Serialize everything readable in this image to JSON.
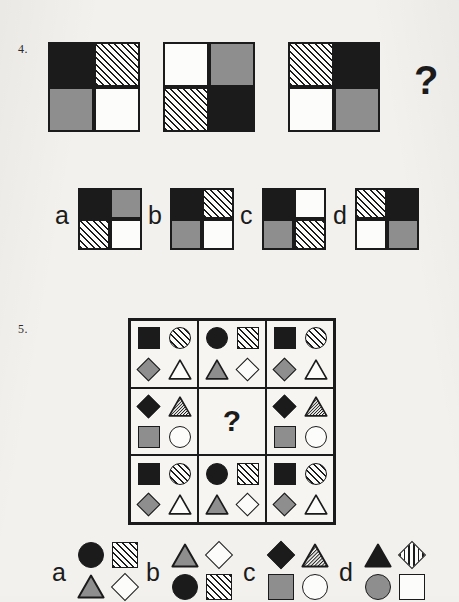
{
  "page": {
    "background_color": "#f3f1ee",
    "ink_color": "#1b1b1b",
    "fills": {
      "black": "#1b1b1b",
      "gray": "#8e8e8e",
      "white": "#fcfcfa",
      "hatch": "diagonal-hatch"
    }
  },
  "questions": [
    {
      "number": "4.",
      "type": "square-series",
      "prompt_symbol": "?",
      "series": [
        {
          "name": "panel-1",
          "cells": [
            {
              "position": "top-left",
              "fill": "black"
            },
            {
              "position": "top-right",
              "fill": "hatch"
            },
            {
              "position": "bottom-left",
              "fill": "gray"
            },
            {
              "position": "bottom-right",
              "fill": "white"
            }
          ]
        },
        {
          "name": "panel-2",
          "cells": [
            {
              "position": "top-left",
              "fill": "white"
            },
            {
              "position": "top-right",
              "fill": "gray"
            },
            {
              "position": "bottom-left",
              "fill": "hatch"
            },
            {
              "position": "bottom-right",
              "fill": "black"
            }
          ]
        },
        {
          "name": "panel-3",
          "cells": [
            {
              "position": "top-left",
              "fill": "hatch"
            },
            {
              "position": "top-right",
              "fill": "black"
            },
            {
              "position": "bottom-left",
              "fill": "white"
            },
            {
              "position": "bottom-right",
              "fill": "gray"
            }
          ]
        }
      ],
      "options": [
        {
          "label": "a",
          "cells": [
            {
              "position": "top-left",
              "fill": "black"
            },
            {
              "position": "top-right",
              "fill": "gray"
            },
            {
              "position": "bottom-left",
              "fill": "hatch"
            },
            {
              "position": "bottom-right",
              "fill": "white"
            }
          ]
        },
        {
          "label": "b",
          "cells": [
            {
              "position": "top-left",
              "fill": "black"
            },
            {
              "position": "top-right",
              "fill": "hatch"
            },
            {
              "position": "bottom-left",
              "fill": "gray"
            },
            {
              "position": "bottom-right",
              "fill": "white"
            }
          ]
        },
        {
          "label": "c",
          "cells": [
            {
              "position": "top-left",
              "fill": "black"
            },
            {
              "position": "top-right",
              "fill": "white"
            },
            {
              "position": "bottom-left",
              "fill": "gray"
            },
            {
              "position": "bottom-right",
              "fill": "hatch"
            }
          ]
        },
        {
          "label": "d",
          "cells": [
            {
              "position": "top-left",
              "fill": "hatch"
            },
            {
              "position": "top-right",
              "fill": "black"
            },
            {
              "position": "bottom-left",
              "fill": "white"
            },
            {
              "position": "bottom-right",
              "fill": "gray"
            }
          ]
        }
      ]
    },
    {
      "number": "5.",
      "type": "shape-matrix-3x3",
      "prompt_symbol": "?",
      "missing_cell": "row2-col2",
      "matrix": [
        [
          {
            "name": "cell-r1c1",
            "shapes": [
              {
                "position": "top-left",
                "shape": "square",
                "fill": "black"
              },
              {
                "position": "top-right",
                "shape": "circle",
                "fill": "hatch"
              },
              {
                "position": "bottom-left",
                "shape": "diamond",
                "fill": "gray"
              },
              {
                "position": "bottom-right",
                "shape": "triangle",
                "fill": "white"
              }
            ]
          },
          {
            "name": "cell-r1c2",
            "shapes": [
              {
                "position": "top-left",
                "shape": "circle",
                "fill": "black"
              },
              {
                "position": "top-right",
                "shape": "square",
                "fill": "hatch"
              },
              {
                "position": "bottom-left",
                "shape": "triangle",
                "fill": "gray"
              },
              {
                "position": "bottom-right",
                "shape": "diamond",
                "fill": "white"
              }
            ]
          },
          {
            "name": "cell-r1c3",
            "shapes": [
              {
                "position": "top-left",
                "shape": "square",
                "fill": "black"
              },
              {
                "position": "top-right",
                "shape": "circle",
                "fill": "hatch"
              },
              {
                "position": "bottom-left",
                "shape": "diamond",
                "fill": "gray"
              },
              {
                "position": "bottom-right",
                "shape": "triangle",
                "fill": "white"
              }
            ]
          }
        ],
        [
          {
            "name": "cell-r2c1",
            "shapes": [
              {
                "position": "top-left",
                "shape": "diamond",
                "fill": "black"
              },
              {
                "position": "top-right",
                "shape": "triangle",
                "fill": "hatch"
              },
              {
                "position": "bottom-left",
                "shape": "square",
                "fill": "gray"
              },
              {
                "position": "bottom-right",
                "shape": "circle",
                "fill": "white"
              }
            ]
          },
          {
            "name": "cell-r2c2",
            "shapes": []
          },
          {
            "name": "cell-r2c3",
            "shapes": [
              {
                "position": "top-left",
                "shape": "diamond",
                "fill": "black"
              },
              {
                "position": "top-right",
                "shape": "triangle",
                "fill": "hatch"
              },
              {
                "position": "bottom-left",
                "shape": "square",
                "fill": "gray"
              },
              {
                "position": "bottom-right",
                "shape": "circle",
                "fill": "white"
              }
            ]
          }
        ],
        [
          {
            "name": "cell-r3c1",
            "shapes": [
              {
                "position": "top-left",
                "shape": "square",
                "fill": "black"
              },
              {
                "position": "top-right",
                "shape": "circle",
                "fill": "hatch"
              },
              {
                "position": "bottom-left",
                "shape": "diamond",
                "fill": "gray"
              },
              {
                "position": "bottom-right",
                "shape": "triangle",
                "fill": "white"
              }
            ]
          },
          {
            "name": "cell-r3c2",
            "shapes": [
              {
                "position": "top-left",
                "shape": "circle",
                "fill": "black"
              },
              {
                "position": "top-right",
                "shape": "square",
                "fill": "hatch"
              },
              {
                "position": "bottom-left",
                "shape": "triangle",
                "fill": "gray"
              },
              {
                "position": "bottom-right",
                "shape": "diamond",
                "fill": "white"
              }
            ]
          },
          {
            "name": "cell-r3c3",
            "shapes": [
              {
                "position": "top-left",
                "shape": "square",
                "fill": "black"
              },
              {
                "position": "top-right",
                "shape": "circle",
                "fill": "hatch"
              },
              {
                "position": "bottom-left",
                "shape": "diamond",
                "fill": "gray"
              },
              {
                "position": "bottom-right",
                "shape": "triangle",
                "fill": "white"
              }
            ]
          }
        ]
      ],
      "options": [
        {
          "label": "a",
          "shapes": [
            {
              "position": "top-left",
              "shape": "circle",
              "fill": "black"
            },
            {
              "position": "top-right",
              "shape": "square",
              "fill": "hatch"
            },
            {
              "position": "bottom-left",
              "shape": "triangle",
              "fill": "gray"
            },
            {
              "position": "bottom-right",
              "shape": "diamond",
              "fill": "white"
            }
          ]
        },
        {
          "label": "b",
          "shapes": [
            {
              "position": "top-left",
              "shape": "triangle",
              "fill": "gray"
            },
            {
              "position": "top-right",
              "shape": "diamond",
              "fill": "white"
            },
            {
              "position": "bottom-left",
              "shape": "circle",
              "fill": "black"
            },
            {
              "position": "bottom-right",
              "shape": "square",
              "fill": "hatch"
            }
          ]
        },
        {
          "label": "c",
          "shapes": [
            {
              "position": "top-left",
              "shape": "diamond",
              "fill": "black"
            },
            {
              "position": "top-right",
              "shape": "triangle",
              "fill": "hatch"
            },
            {
              "position": "bottom-left",
              "shape": "square",
              "fill": "gray"
            },
            {
              "position": "bottom-right",
              "shape": "circle",
              "fill": "white"
            }
          ]
        },
        {
          "label": "d",
          "shapes": [
            {
              "position": "top-left",
              "shape": "triangle",
              "fill": "black"
            },
            {
              "position": "top-right",
              "shape": "diamond",
              "fill": "hatch"
            },
            {
              "position": "bottom-left",
              "shape": "circle",
              "fill": "gray"
            },
            {
              "position": "bottom-right",
              "shape": "square",
              "fill": "white"
            }
          ]
        }
      ]
    }
  ]
}
